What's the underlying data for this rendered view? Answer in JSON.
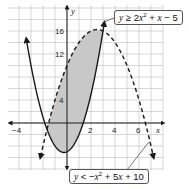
{
  "chart_data": {
    "type": "line",
    "title": "",
    "xlabel": "x",
    "ylabel": "y",
    "xlim": [
      -5,
      8
    ],
    "ylim": [
      -8,
      20
    ],
    "grid": true,
    "x_ticks": [
      -4,
      2,
      4,
      6
    ],
    "y_ticks": [
      4,
      12,
      16
    ],
    "series": [
      {
        "name": "y ≥ 2x² + x − 5",
        "equation": "y = 2x^2 + x - 5",
        "inequality": ">=",
        "line_style": "solid",
        "vertex": [
          -0.25,
          -5.125
        ]
      },
      {
        "name": "y < −x² + 5x + 10",
        "equation": "y = -x^2 + 5x + 10",
        "inequality": "<",
        "line_style": "dashed",
        "vertex": [
          2.5,
          16.25
        ]
      }
    ],
    "shaded_region": {
      "description": "solution region between the two parabolas",
      "x_range": [
        -1.667,
        3
      ],
      "intersections": [
        [
          -1.667,
          -1.111
        ],
        [
          3,
          16
        ]
      ]
    },
    "annotations": [
      {
        "text": "y ≥ 2x² + x − 5",
        "position": "top-right"
      },
      {
        "text": "y < −x² + 5x + 10",
        "position": "bottom-right"
      }
    ]
  },
  "labels": {
    "tick_neg4": "−4",
    "tick_2": "2",
    "tick_4": "4",
    "tick_6": "6",
    "tick_y4": "4",
    "tick_y12": "12",
    "tick_y16": "16",
    "x_axis": "x",
    "y_axis": "y"
  },
  "callouts": {
    "top": {
      "y": "y",
      "rel": " ≥ 2",
      "x2": "x",
      "sup": "2",
      "rest": " + ",
      "x": "x",
      "tail": " − 5"
    },
    "bottom": {
      "y": "y",
      "rel": " < −",
      "x2": "x",
      "sup": "2",
      "rest": " + 5",
      "x": "x",
      "tail": " + 10"
    }
  },
  "colors": {
    "shade": "#c8c8c8",
    "grid": "#bdbdbd",
    "curve": "#1a1a1a"
  }
}
